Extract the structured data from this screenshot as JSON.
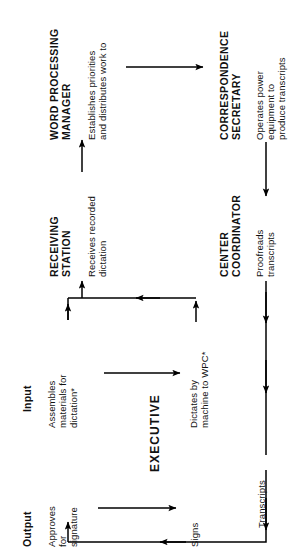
{
  "diagram": {
    "orientation": "rotated-90-ccw",
    "ink_color": "#000000",
    "background_color": "#ffffff"
  },
  "labels": {
    "input": "Input",
    "output": "Output",
    "executive": "EXECUTIVE"
  },
  "roles": {
    "word_processing_manager": "WORD PROCESSING\nMANAGER",
    "correspondence_secretary": "CORRESPONDENCE\nSECRETARY",
    "receiving_station": "RECEIVING\nSTATION",
    "center_coordinator": "CENTER\nCOORDINATOR"
  },
  "actions": {
    "establishes": "Establishes priorities\nand distributes work to",
    "operates": "Operates power\nequipment to\nproduce transcripts",
    "receives": "Receives recorded\ndictation",
    "proofreads": "Proofreads\ntranscripts",
    "assembles": "Assembles\nmaterials for\ndictation*",
    "dictates": "Dictates by\nmachine to WPC*",
    "transcripts": "Transcripts",
    "approves": "Approves\nfor\nsignature",
    "signs": "Signs"
  }
}
